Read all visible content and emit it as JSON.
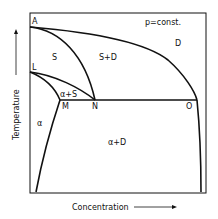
{
  "diagram": {
    "title": "p=const.",
    "xlabel": "Concentration",
    "ylabel": "Temperature",
    "points": {
      "A": "A",
      "L": "L",
      "M": "M",
      "N": "N",
      "O": "O"
    },
    "regions": {
      "S": "S",
      "S_D": "S+D",
      "D": "D",
      "alpha_S": "α+S",
      "alpha": "α",
      "alpha_D": "α+D"
    }
  }
}
